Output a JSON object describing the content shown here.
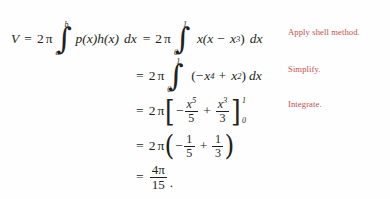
{
  "document": {
    "type": "math-derivation",
    "title": "Shell method volume computation",
    "background_color": "#fefefe",
    "text_color": "#231f20",
    "annotation_color": "#c0504d"
  },
  "equation": {
    "line1": {
      "lhs": "V",
      "equals": "=",
      "coefficient": "2",
      "pi": "π",
      "integral_lower": "a",
      "integral_upper": "b",
      "integrand": "p(x)h(x)",
      "differential": "dx",
      "equals2": "=",
      "coefficient2": "2",
      "pi2": "π",
      "integral2_lower": "0",
      "integral2_upper": "1",
      "integrand2_a": "x(x",
      "integrand2_op": "−",
      "integrand2_b": "x",
      "integrand2_b_exp": "3",
      "integrand2_close": ")",
      "differential2": "dx"
    },
    "line2": {
      "equals": "=",
      "coefficient": "2",
      "pi": "π",
      "integral_lower": "0",
      "integral_upper": "1",
      "open_paren": "(",
      "term1_sign": "−",
      "term1_base": "x",
      "term1_exp": "4",
      "op": "+",
      "term2_base": "x",
      "term2_exp": "2",
      "close_paren": ")",
      "differential": "dx"
    },
    "line3": {
      "equals": "=",
      "coefficient": "2",
      "pi": "π",
      "open_bracket": "[",
      "frac1_sign": "−",
      "frac1_num_base": "x",
      "frac1_num_exp": "5",
      "frac1_den": "5",
      "op": "+",
      "frac2_num_base": "x",
      "frac2_num_exp": "3",
      "frac2_den": "3",
      "close_bracket": "]",
      "limit_upper": "1",
      "limit_lower": "0"
    },
    "line4": {
      "equals": "=",
      "coefficient": "2",
      "pi": "π",
      "open_paren": "(",
      "frac1_sign": "−",
      "frac1_num": "1",
      "frac1_den": "5",
      "op": "+",
      "frac2_num": "1",
      "frac2_den": "3",
      "close_paren": ")"
    },
    "line5": {
      "equals": "=",
      "num_coefficient": "4",
      "num_pi": "π",
      "den": "15",
      "period": "."
    }
  },
  "annotations": [
    {
      "label": "Apply shell method."
    },
    {
      "label": "Simplify."
    },
    {
      "label": "Integrate."
    }
  ]
}
